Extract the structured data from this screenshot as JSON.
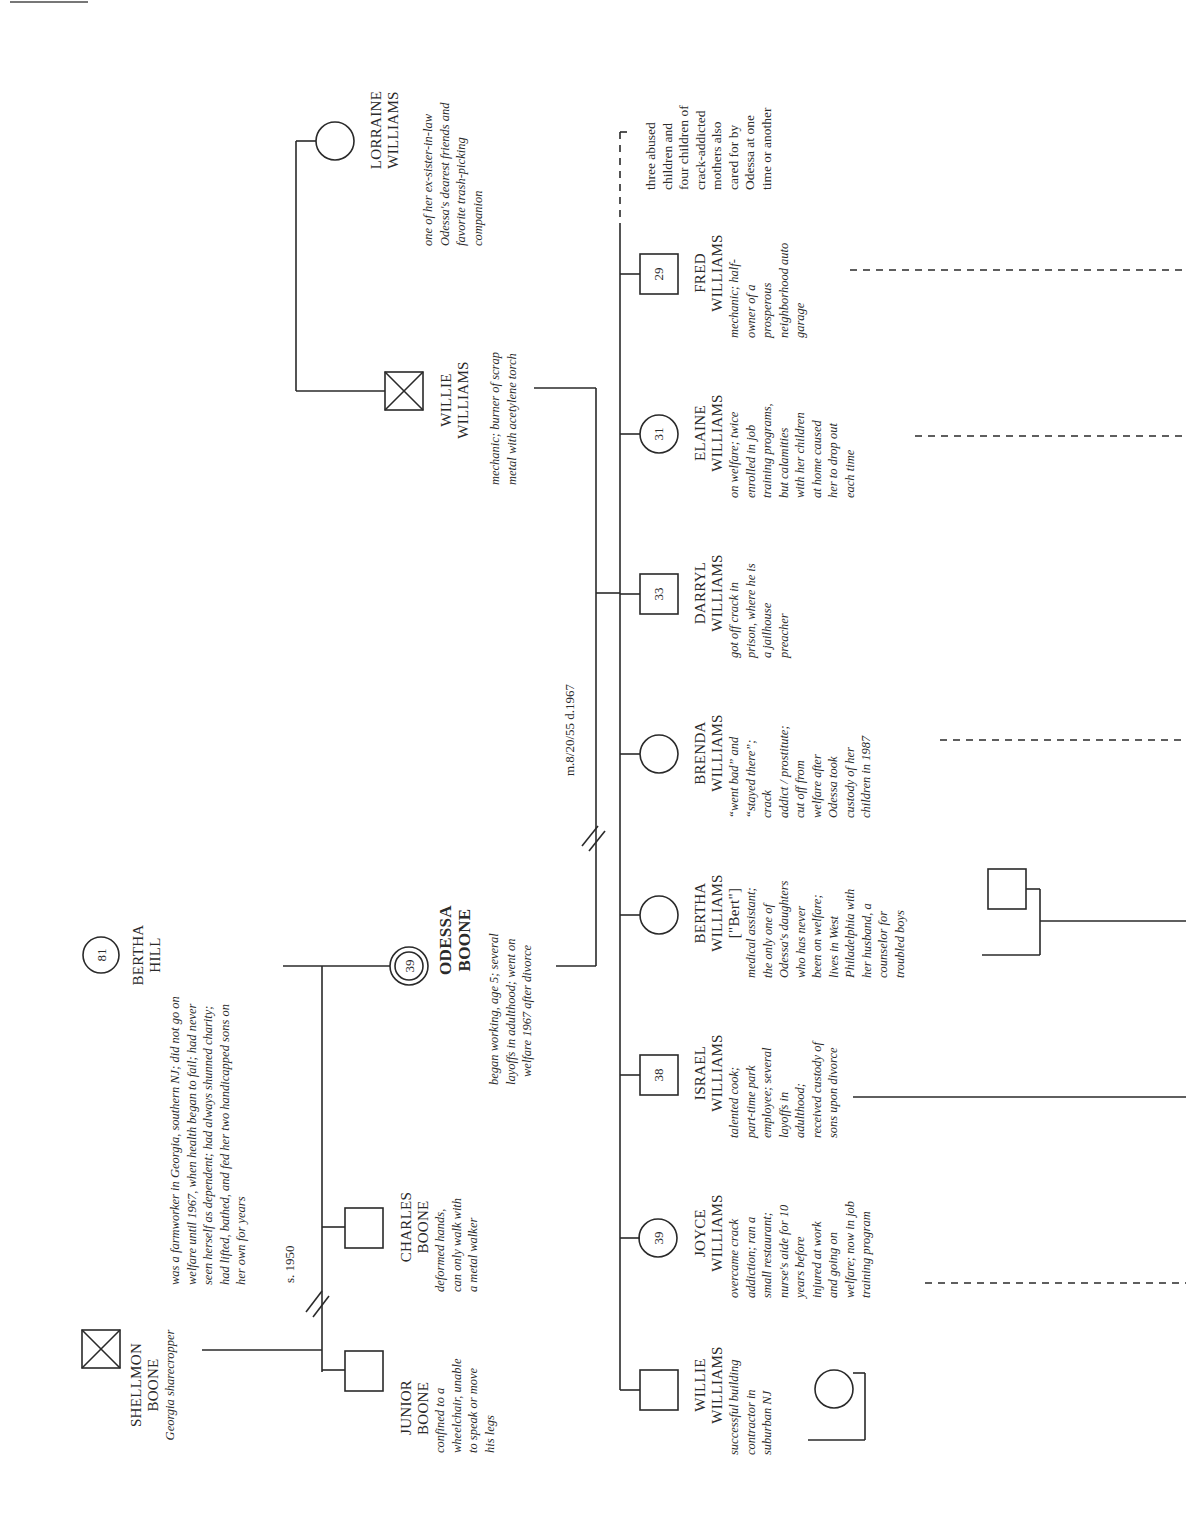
{
  "figure": {
    "orientation": "rotated-90-ccw",
    "type": "genogram"
  },
  "generation1": {
    "shellmon": {
      "name": [
        "SHELLMON",
        "BOONE"
      ],
      "desc": [
        "Georgia sharecropper"
      ],
      "symbol": "square-deceased"
    },
    "bertha_hill": {
      "name": [
        "BERTHA",
        "HILL"
      ],
      "age": "81",
      "symbol": "circle",
      "desc": [
        "was a farmworker in Georgia, southern NJ; did not go on",
        "welfare until 1967, when health began to fail; had never",
        "seen herself as dependent; had always shunned charity;",
        "had lifted, bathed, and fed her two handicapped sons on",
        "her own for years"
      ]
    },
    "separation_label": "s. 1950"
  },
  "generation2": {
    "junior": {
      "name": [
        "JUNIOR",
        "BOONE"
      ],
      "desc": [
        "confined to a",
        "wheelchair, unable",
        "to speak or move",
        "his legs"
      ],
      "symbol": "square"
    },
    "charles": {
      "name": [
        "CHARLES",
        "BOONE"
      ],
      "desc": [
        "deformed hands,",
        "can only walk with",
        "a metal walker"
      ],
      "symbol": "square"
    },
    "odessa": {
      "name": [
        "ODESSA",
        "BOONE"
      ],
      "age": "39",
      "symbol": "double-circle-index",
      "desc": [
        "began working, age 5; several",
        "layoffs in adulthood; went on",
        "welfare 1967 after divorce"
      ]
    },
    "willie_sr": {
      "name": [
        "WILLIE",
        "WILLIAMS"
      ],
      "desc": [
        "mechanic; burner of scrap",
        "metal with acetylene torch"
      ],
      "symbol": "square-deceased"
    },
    "lorraine": {
      "name": [
        "LORRAINE",
        "WILLIAMS"
      ],
      "symbol": "circle",
      "desc": [
        "one of her ex-sister-in-law",
        "Odessa's dearest friends and",
        "favorite trash-picking",
        "companion"
      ]
    },
    "marriage_label": "m.8/20/55 d.1967"
  },
  "generation3": [
    {
      "key": "willie_jr",
      "name": [
        "WILLIE",
        "WILLIAMS"
      ],
      "age": "",
      "symbol": "square",
      "desc": [
        "successful building",
        "contractor in",
        "suburban NJ"
      ]
    },
    {
      "key": "joyce",
      "name": [
        "JOYCE",
        "WILLIAMS"
      ],
      "age": "39",
      "symbol": "circle",
      "desc": [
        "overcame crack",
        "addiction; ran a",
        "small restaurant;",
        "nurse's aide for 10",
        "years before",
        "injured at work",
        "and going on",
        "welfare; now in job",
        "training program"
      ]
    },
    {
      "key": "israel",
      "name": [
        "ISRAEL",
        "WILLIAMS"
      ],
      "age": "38",
      "symbol": "square",
      "desc": [
        "talented cook;",
        "part-time park",
        "employee; several",
        "layoffs in",
        "adulthood;",
        "received custody of",
        "sons upon divorce"
      ]
    },
    {
      "key": "bertha_w",
      "name": [
        "BERTHA",
        "WILLIAMS",
        "[\"Bert\"]"
      ],
      "age": "",
      "symbol": "circle",
      "desc": [
        "medical assistant;",
        "the only one of",
        "Odessa's daughters",
        "who has never",
        "been on welfare;",
        "lives in West",
        "Philadelphia with",
        "her husband, a",
        "counselor for",
        "troubled boys"
      ]
    },
    {
      "key": "brenda",
      "name": [
        "BRENDA",
        "WILLIAMS"
      ],
      "age": "",
      "symbol": "circle",
      "desc": [
        "“went bad” and",
        "“stayed there”;",
        "crack",
        "addict / prostitute;",
        "cut off from",
        "welfare after",
        "Odessa took",
        "custody of her",
        "children in 1987"
      ]
    },
    {
      "key": "darryl",
      "name": [
        "DARRYL",
        "WILLIAMS"
      ],
      "age": "33",
      "symbol": "square",
      "desc": [
        "got off crack in",
        "prison, where he is",
        "a jailhouse",
        "preacher"
      ]
    },
    {
      "key": "elaine",
      "name": [
        "ELAINE",
        "WILLIAMS"
      ],
      "age": "31",
      "symbol": "circle",
      "desc": [
        "on welfare; twice",
        "enrolled in job",
        "training programs,",
        "but calamities",
        "with her children",
        "at home caused",
        "her to drop out",
        "each time"
      ]
    },
    {
      "key": "fred",
      "name": [
        "FRED",
        "WILLIAMS"
      ],
      "age": "29",
      "symbol": "square",
      "desc": [
        "mechanic; half-",
        "owner of a",
        "prosperous",
        "neighborhood auto",
        "garage"
      ]
    }
  ],
  "foster_note": [
    "three abused",
    "children and",
    "four children of",
    "crack-addicted",
    "mothers also",
    "cared for by",
    "Odessa at one",
    "time or another"
  ]
}
